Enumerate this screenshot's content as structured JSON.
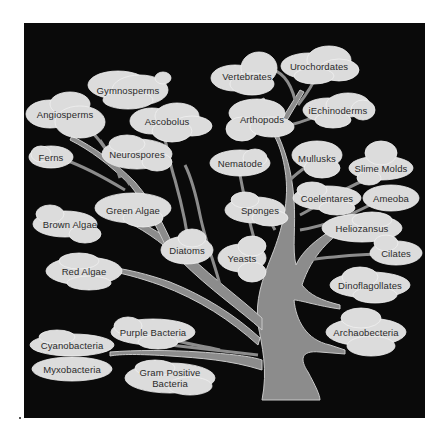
{
  "diagram": {
    "type": "tree-of-life",
    "colors": {
      "background": "#0a0a0a",
      "trunk": "#8c8c8c",
      "cloud": "#dcdcdc",
      "text": "#2a2a2a",
      "page": "#ffffff"
    },
    "nodes": [
      {
        "id": "vertebrates",
        "label": "Vertebrates",
        "x": 247,
        "y": 76
      },
      {
        "id": "urochordates",
        "label": "Urochordates",
        "x": 319,
        "y": 66
      },
      {
        "id": "gymnosperms",
        "label": "Gymnosperms",
        "x": 128,
        "y": 90
      },
      {
        "id": "angiosperms",
        "label": "Angiosperms",
        "x": 65,
        "y": 114
      },
      {
        "id": "ascobolus",
        "label": "Ascobolus",
        "x": 167,
        "y": 121
      },
      {
        "id": "arthopods",
        "label": "Arthopods",
        "x": 262,
        "y": 119
      },
      {
        "id": "echinoderms",
        "label": "iEchinoderms",
        "x": 338,
        "y": 110
      },
      {
        "id": "ferns",
        "label": "Ferns",
        "x": 51,
        "y": 157
      },
      {
        "id": "neurospores",
        "label": "Neurospores",
        "x": 137,
        "y": 154
      },
      {
        "id": "nematode",
        "label": "Nematode",
        "x": 240,
        "y": 163
      },
      {
        "id": "mullusks",
        "label": "Mullusks",
        "x": 317,
        "y": 158
      },
      {
        "id": "slime-molds",
        "label": "Slime Molds",
        "x": 381,
        "y": 168
      },
      {
        "id": "coelentares",
        "label": "Coelentares",
        "x": 327,
        "y": 198
      },
      {
        "id": "ameoba",
        "label": "Ameoba",
        "x": 391,
        "y": 198
      },
      {
        "id": "sponges",
        "label": "Sponges",
        "x": 260,
        "y": 210
      },
      {
        "id": "green-algae",
        "label": "Green Algae",
        "x": 133,
        "y": 210
      },
      {
        "id": "brown-algae",
        "label": "Brown Algae",
        "x": 70,
        "y": 224
      },
      {
        "id": "heliozansus",
        "label": "Heliozansus",
        "x": 362,
        "y": 228
      },
      {
        "id": "diatoms",
        "label": "Diatoms",
        "x": 187,
        "y": 250
      },
      {
        "id": "yeasts",
        "label": "Yeasts",
        "x": 242,
        "y": 258
      },
      {
        "id": "cilates",
        "label": "Cilates",
        "x": 396,
        "y": 253
      },
      {
        "id": "red-algae",
        "label": "Red Algae",
        "x": 84,
        "y": 271
      },
      {
        "id": "dinoflagollates",
        "label": "Dinoflagollates",
        "x": 370,
        "y": 285
      },
      {
        "id": "archaobecteria",
        "label": "Archaobecteria",
        "x": 366,
        "y": 332
      },
      {
        "id": "purple-bacteria",
        "label": "Purple Bacteria",
        "x": 153,
        "y": 332
      },
      {
        "id": "cyanobacteria",
        "label": "Cyanobacteria",
        "x": 72,
        "y": 345
      },
      {
        "id": "myxobacteria",
        "label": "Myxobacteria",
        "x": 72,
        "y": 369
      },
      {
        "id": "gram-positive-bacteria",
        "label": "Gram Positive\nBacteria",
        "x": 170,
        "y": 378
      }
    ]
  }
}
